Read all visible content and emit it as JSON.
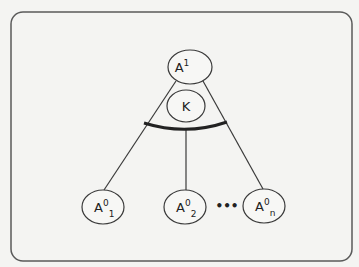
{
  "diagram": {
    "root": {
      "base": "A",
      "sup": "1",
      "sub": ""
    },
    "kernel": {
      "label": "K"
    },
    "children": [
      {
        "base": "A",
        "sup": "0",
        "sub": "1"
      },
      {
        "base": "A",
        "sup": "0",
        "sub": "2"
      },
      {
        "base": "A",
        "sup": "0",
        "sub": "n"
      }
    ],
    "ellipsis": "•••",
    "colors": {
      "stroke": "#3a3a3a",
      "frame": "#5a5a5a",
      "background": "#f4f4f2",
      "node_fill": "#f7f7f5"
    }
  }
}
